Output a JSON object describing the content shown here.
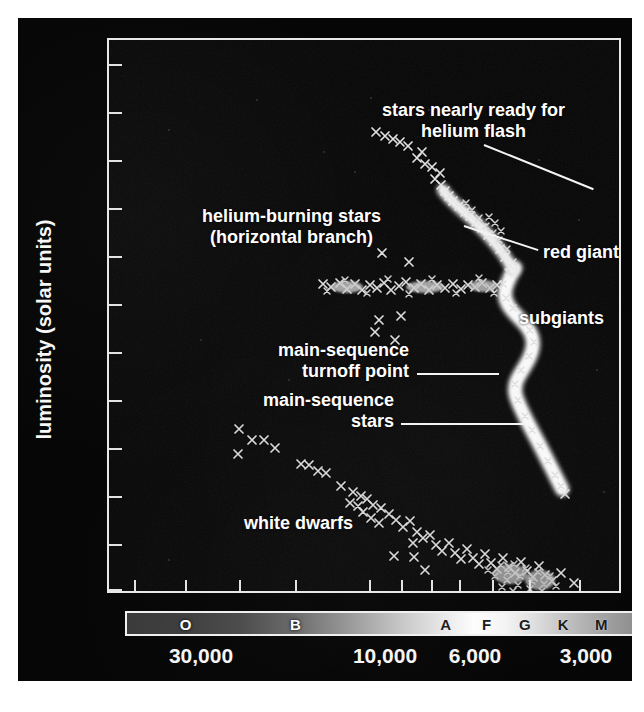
{
  "figure": {
    "title_alt": "Hertzsprung-Russell diagram of a globular cluster"
  },
  "axes": {
    "x": {
      "label": "surface temperature (Kelvin)",
      "tick_labels": [
        "30,000",
        "10,000",
        "6,000",
        "3,000"
      ],
      "tick_values": [
        30000,
        10000,
        6000,
        3000
      ],
      "direction": "decreasing",
      "scale": "log-reversed"
    },
    "y": {
      "label": "luminosity (solar units)",
      "tick_labels": [
        "10^6",
        "10^5",
        "10^4",
        "10^3",
        "10^2",
        "10",
        "1",
        "0.1",
        "10^-2",
        "10^-3",
        "10^-4",
        "10^-5"
      ],
      "tick_html": [
        "10<sup>6</sup>",
        "10<sup>5</sup>",
        "10<sup>4</sup>",
        "10<sup>3</sup>",
        "10<sup>2</sup>",
        "10",
        "1",
        "0.1",
        "10<sup>−2</sup>",
        "10<sup>−3</sup>",
        "10<sup>−4</sup>",
        "10<sup>−5</sup>"
      ],
      "scale": "log",
      "ylim": [
        1e-05,
        1000000.0
      ]
    }
  },
  "spectral_bar": {
    "classes": [
      "O",
      "B",
      "A",
      "F",
      "G",
      "K",
      "M"
    ],
    "colors_hex": [
      "#3a3a3a",
      "#6a6a6a",
      "#d8d8d8",
      "#fdfdfd",
      "#f0f0f0",
      "#c2c2c2",
      "#8c8c8c"
    ]
  },
  "annotations": [
    {
      "id": "helium-flash",
      "line1": "stars nearly ready for",
      "line2": "helium flash"
    },
    {
      "id": "helium-burning",
      "line1": "helium-burning stars",
      "line2": "(horizontal branch)"
    },
    {
      "id": "red-giants",
      "line1": "red giants",
      "line2": ""
    },
    {
      "id": "subgiants",
      "line1": "subgiants",
      "line2": ""
    },
    {
      "id": "ms-turnoff",
      "line1": "main-sequence",
      "line2": "turnoff point"
    },
    {
      "id": "ms-stars",
      "line1": "main-sequence",
      "line2": "stars"
    },
    {
      "id": "white-dwarfs",
      "line1": "white dwarfs",
      "line2": ""
    }
  ],
  "chart_data": {
    "type": "scatter",
    "title": "",
    "xlabel": "surface temperature (Kelvin)",
    "ylabel": "luminosity (solar units)",
    "xlim": [
      40000,
      2500
    ],
    "ylim": [
      1e-05,
      1000000.0
    ],
    "xscale": "log-reversed",
    "yscale": "log",
    "grid": false,
    "legend": "none",
    "xticks": [
      30000,
      10000,
      6000,
      3000
    ],
    "yticks": [
      1000000.0,
      100000.0,
      10000.0,
      1000.0,
      100,
      10,
      1,
      0.1,
      0.01,
      0.001,
      0.0001,
      1e-05
    ],
    "marker": "x",
    "marker_color": "#e6e6e6",
    "series": [
      {
        "name": "main-sequence stars",
        "note": "dense bright band, lower-right S-curve",
        "points": [
          [
            7200,
            3.2
          ],
          [
            7000,
            2.4
          ],
          [
            6900,
            1.8
          ],
          [
            6800,
            1.4
          ],
          [
            6700,
            1.15
          ],
          [
            6600,
            0.95
          ],
          [
            6500,
            0.8
          ],
          [
            6400,
            0.66
          ],
          [
            6300,
            0.55
          ],
          [
            6200,
            0.46
          ],
          [
            6100,
            0.38
          ],
          [
            6000,
            0.31
          ],
          [
            5900,
            0.25
          ],
          [
            5800,
            0.21
          ],
          [
            5700,
            0.17
          ],
          [
            5600,
            0.14
          ],
          [
            5450,
            0.115
          ],
          [
            5300,
            0.095
          ],
          [
            5150,
            0.078
          ],
          [
            5000,
            0.062
          ],
          [
            4850,
            0.048
          ],
          [
            4700,
            0.036
          ],
          [
            4550,
            0.027
          ],
          [
            4400,
            0.02
          ],
          [
            4250,
            0.0145
          ],
          [
            4100,
            0.0105
          ],
          [
            3950,
            0.0075
          ],
          [
            3800,
            0.0053
          ],
          [
            3650,
            0.0037
          ],
          [
            3500,
            0.0026
          ],
          [
            3350,
            0.0018
          ],
          [
            3200,
            0.0013
          ],
          [
            3050,
            0.0009
          ],
          [
            2950,
            0.00065
          ],
          [
            2870,
            0.0005
          ]
        ]
      },
      {
        "name": "subgiants",
        "note": "branch rising rightward from turnoff",
        "points": [
          [
            6200,
            5
          ],
          [
            6000,
            7
          ],
          [
            5800,
            9
          ],
          [
            5600,
            12
          ],
          [
            5450,
            16
          ],
          [
            5300,
            21
          ],
          [
            5150,
            26
          ],
          [
            5000,
            33
          ],
          [
            4900,
            40
          ]
        ]
      },
      {
        "name": "red giants",
        "note": "steep red-giant branch",
        "points": [
          [
            4850,
            48
          ],
          [
            4750,
            62
          ],
          [
            4650,
            80
          ],
          [
            4550,
            100
          ],
          [
            4450,
            130
          ],
          [
            4350,
            165
          ],
          [
            4250,
            210
          ],
          [
            4150,
            270
          ],
          [
            4050,
            340
          ],
          [
            3950,
            430
          ],
          [
            3850,
            540
          ],
          [
            3780,
            680
          ],
          [
            3700,
            840
          ],
          [
            3640,
            960
          ]
        ]
      },
      {
        "name": "stars nearly ready for helium flash",
        "note": "tip of the red-giant branch",
        "points": [
          [
            3560,
            1100
          ],
          [
            3480,
            1250
          ],
          [
            3400,
            1450
          ],
          [
            3330,
            1700
          ],
          [
            3260,
            1900
          ],
          [
            3180,
            2100
          ]
        ]
      },
      {
        "name": "helium-burning stars (horizontal branch)",
        "note": "horizontal row at L ~ 40 solar",
        "points": [
          [
            13500,
            42
          ],
          [
            12800,
            38
          ],
          [
            12200,
            44
          ],
          [
            11600,
            36
          ],
          [
            11000,
            40
          ],
          [
            10600,
            45
          ],
          [
            10200,
            37
          ],
          [
            9800,
            42
          ],
          [
            9400,
            39
          ],
          [
            9000,
            33
          ],
          [
            8600,
            44
          ],
          [
            8200,
            40
          ],
          [
            7800,
            36
          ],
          [
            7400,
            43
          ],
          [
            7000,
            38
          ],
          [
            6700,
            41
          ],
          [
            6400,
            45
          ],
          [
            6200,
            39
          ],
          [
            9600,
            95
          ],
          [
            8400,
            60
          ],
          [
            9100,
            9
          ],
          [
            8300,
            6
          ],
          [
            8700,
            11
          ]
        ]
      },
      {
        "name": "white dwarfs",
        "note": "faint sequence in lower-left to lower-middle",
        "points": [
          [
            15500,
            0.035
          ],
          [
            15300,
            0.0068
          ],
          [
            14500,
            0.018
          ],
          [
            13900,
            0.019
          ],
          [
            13300,
            0.0105
          ],
          [
            11800,
            0.0052
          ],
          [
            11400,
            0.0047
          ],
          [
            11000,
            0.0042
          ],
          [
            10400,
            0.0022
          ],
          [
            10000,
            0.00155
          ],
          [
            9700,
            0.00125
          ],
          [
            9400,
            0.0011
          ],
          [
            9100,
            0.00098
          ],
          [
            8800,
            0.00088
          ],
          [
            8500,
            0.00076
          ],
          [
            8300,
            0.0013
          ],
          [
            8000,
            0.00068
          ],
          [
            7800,
            0.00058
          ],
          [
            7500,
            0.00049
          ],
          [
            7200,
            0.00042
          ],
          [
            6900,
            0.00035
          ],
          [
            6600,
            0.0003
          ],
          [
            6400,
            0.00024
          ],
          [
            6200,
            0.00021
          ],
          [
            6000,
            0.00017
          ],
          [
            5800,
            0.000145
          ],
          [
            5600,
            0.000125
          ],
          [
            5450,
            0.000105
          ],
          [
            5300,
            9.2e-05
          ],
          [
            5150,
            8.2e-05
          ],
          [
            5000,
            7.2e-05
          ],
          [
            4900,
            6.4e-05
          ],
          [
            4800,
            5.8e-05
          ],
          [
            4700,
            5.2e-05
          ],
          [
            4600,
            4.7e-05
          ],
          [
            4500,
            4.2e-05
          ],
          [
            4400,
            3.8e-05
          ],
          [
            4300,
            3.4e-05
          ],
          [
            4200,
            3e-05
          ],
          [
            4100,
            2.7e-05
          ],
          [
            4000,
            2.4e-05
          ],
          [
            3900,
            2.1e-05
          ],
          [
            3800,
            1.85e-05
          ],
          [
            9300,
            0.000105
          ],
          [
            8700,
            9.8e-05
          ],
          [
            6300,
            9.5e-05
          ],
          [
            6000,
            8.9e-05
          ],
          [
            5700,
            4.2e-05
          ],
          [
            5100,
            3.5e-05
          ],
          [
            4550,
            3.3e-05
          ],
          [
            4450,
            5.8e-05
          ],
          [
            4350,
            6.5e-05
          ],
          [
            4250,
            5.5e-05
          ],
          [
            4150,
            4.6e-05
          ],
          [
            4050,
            4e-05
          ],
          [
            3950,
            1.55e-05
          ],
          [
            3700,
            1.75e-05
          ],
          [
            3550,
            1.45e-05
          ],
          [
            3400,
            2.55e-05
          ]
        ]
      }
    ]
  }
}
